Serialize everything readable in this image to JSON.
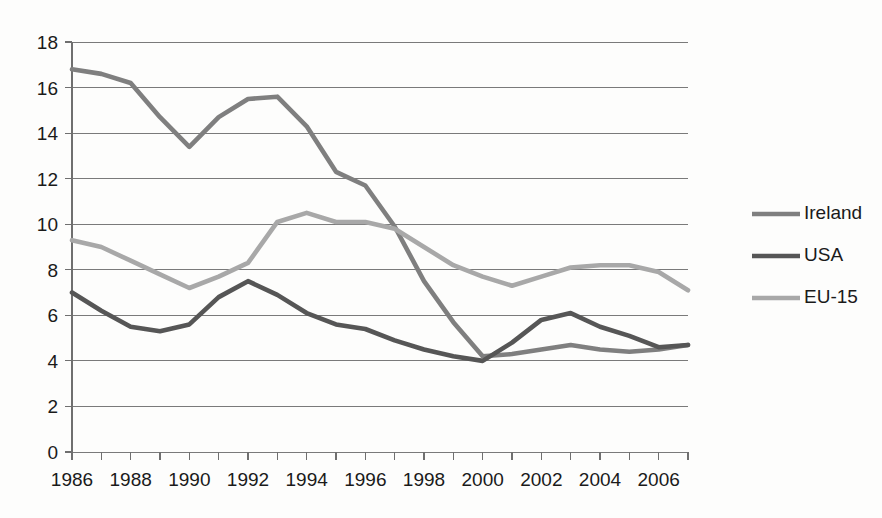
{
  "chart_data": {
    "type": "line",
    "title": "",
    "xlabel": "",
    "ylabel": "",
    "xlim": [
      1986,
      2007
    ],
    "ylim": [
      0,
      18
    ],
    "y_tick_step": 2,
    "grid": "horizontal",
    "legend_position": "right",
    "x": [
      1986,
      1987,
      1988,
      1989,
      1990,
      1991,
      1992,
      1993,
      1994,
      1995,
      1996,
      1997,
      1998,
      1999,
      2000,
      2001,
      2002,
      2003,
      2004,
      2005,
      2006,
      2007
    ],
    "x_tick_labels": [
      "1986",
      "1988",
      "1990",
      "1992",
      "1994",
      "1996",
      "1998",
      "2000",
      "2002",
      "2004",
      "2006"
    ],
    "y_tick_labels": [
      "0",
      "2",
      "4",
      "6",
      "8",
      "10",
      "12",
      "14",
      "16",
      "18"
    ],
    "series": [
      {
        "name": "Ireland",
        "color": "#7f7f7f",
        "values": [
          16.8,
          16.6,
          16.2,
          14.7,
          13.4,
          14.7,
          15.5,
          15.6,
          14.3,
          12.3,
          11.7,
          9.9,
          7.5,
          5.7,
          4.2,
          4.3,
          4.5,
          4.7,
          4.5,
          4.4,
          4.5,
          4.7
        ]
      },
      {
        "name": "USA",
        "color": "#565656",
        "values": [
          7.0,
          6.2,
          5.5,
          5.3,
          5.6,
          6.8,
          7.5,
          6.9,
          6.1,
          5.6,
          5.4,
          4.9,
          4.5,
          4.2,
          4.0,
          4.8,
          5.8,
          6.1,
          5.5,
          5.1,
          4.6,
          4.7
        ]
      },
      {
        "name": "EU-15",
        "color": "#a8a8a8",
        "values": [
          9.3,
          9.0,
          8.4,
          7.8,
          7.2,
          7.7,
          8.3,
          10.1,
          10.5,
          10.1,
          10.1,
          9.8,
          9.0,
          8.2,
          7.7,
          7.3,
          7.7,
          8.1,
          8.2,
          8.2,
          7.9,
          7.1
        ]
      }
    ]
  },
  "legend": {
    "items": [
      {
        "label": "Ireland"
      },
      {
        "label": "USA"
      },
      {
        "label": "EU-15"
      }
    ]
  },
  "colors": {
    "ireland": "#7f7f7f",
    "usa": "#565656",
    "eu15": "#a8a8a8",
    "gridline": "#7a7a7a",
    "text": "#1a1a1a",
    "background": "#fdfdfc"
  }
}
